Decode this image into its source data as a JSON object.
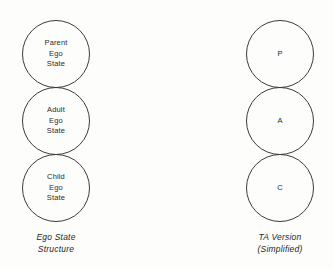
{
  "diagram": {
    "stroke_color": "#3b3b3b",
    "text_color": "#2b2b2b",
    "background_color": "#fdfdfc",
    "columns": [
      {
        "name": "ego-state-structure",
        "caption": "Ego State\nStructure",
        "circles": [
          {
            "name": "parent",
            "label": "Parent\nEgo\nState"
          },
          {
            "name": "adult",
            "label": "Adult\nEgo\nState"
          },
          {
            "name": "child",
            "label": "Child\nEgo\nState"
          }
        ]
      },
      {
        "name": "ta-version-simplified",
        "caption": "TA Version\n(Simplified)",
        "circles": [
          {
            "name": "parent",
            "label": "P"
          },
          {
            "name": "adult",
            "label": "A"
          },
          {
            "name": "child",
            "label": "C"
          }
        ]
      }
    ]
  },
  "chart_data": {
    "type": "diagram",
    "layout": "two vertical stacks of three tangent circles",
    "groups": [
      {
        "caption": "Ego State Structure",
        "nodes": [
          "Parent Ego State",
          "Adult Ego State",
          "Child Ego State"
        ]
      },
      {
        "caption": "TA Version (Simplified)",
        "nodes": [
          "P",
          "A",
          "C"
        ]
      }
    ]
  }
}
